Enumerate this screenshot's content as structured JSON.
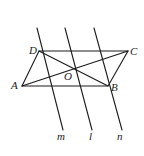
{
  "figure": {
    "stroke_color": "#1a1a1a",
    "points": {
      "A": {
        "label": "A",
        "x": 22,
        "y": 86
      },
      "B": {
        "label": "B",
        "x": 108,
        "y": 86
      },
      "C": {
        "label": "C",
        "x": 128,
        "y": 51
      },
      "D": {
        "label": "D",
        "x": 39,
        "y": 51
      },
      "O": {
        "label": "O",
        "x": 75,
        "y": 68.5
      }
    },
    "lines": {
      "m": {
        "label": "m",
        "x1": 37,
        "y1": 28,
        "x2": 63,
        "y2": 130
      },
      "l": {
        "label": "l",
        "x1": 65,
        "y1": 28,
        "x2": 92,
        "y2": 130
      },
      "n": {
        "label": "n",
        "x1": 94,
        "y1": 28,
        "x2": 122,
        "y2": 130
      }
    }
  }
}
